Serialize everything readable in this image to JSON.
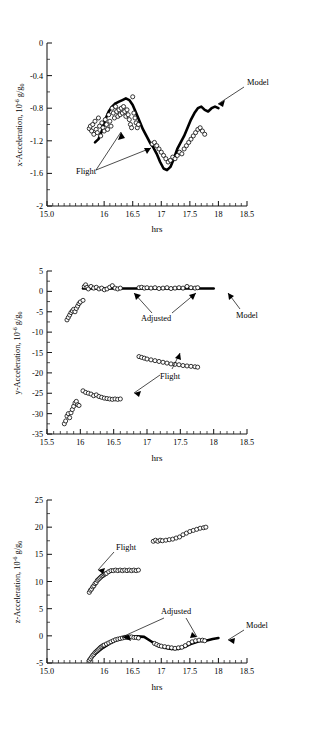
{
  "figure": {
    "panels": [
      {
        "id": "x-acceleration",
        "axis": {
          "xlabel": "hrs",
          "ylabel_main": "x-Acceleration, 10",
          "ylabel_sup": "-6",
          "ylabel_tail": " g/g",
          "ylabel_sub": "0",
          "xticks": [
            "15.0",
            "16",
            "16.5",
            "17",
            "17.5",
            "18",
            "18.5"
          ],
          "yticks": [
            "0",
            "-0.4",
            "-0.8",
            "-1.2",
            "-1.6",
            "-2"
          ]
        },
        "annotations": [
          {
            "label": "Model"
          },
          {
            "label": "Flight"
          }
        ]
      },
      {
        "id": "y-acceleration",
        "axis": {
          "xlabel": "hrs",
          "ylabel_main": "y-Acceleration, 10",
          "ylabel_sup": "-6",
          "ylabel_tail": " g/g",
          "ylabel_sub": "0",
          "xticks": [
            "15.5",
            "16",
            "16.5",
            "17",
            "17.5",
            "18",
            "18.5"
          ],
          "yticks": [
            "5",
            "0",
            "-5",
            "-10",
            "-15",
            "-20",
            "-25",
            "-30",
            "-35"
          ]
        },
        "annotations": [
          {
            "label": "Adjusted"
          },
          {
            "label": "Model"
          },
          {
            "label": "Flight"
          }
        ]
      },
      {
        "id": "z-acceleration",
        "axis": {
          "xlabel": "hrs",
          "ylabel_main": "z-Acceleration, 10",
          "ylabel_sup": "-6",
          "ylabel_tail": " g/g",
          "ylabel_sub": "0",
          "xticks": [
            "15.0",
            "16",
            "16.5",
            "17",
            "17.5",
            "18",
            "18.5"
          ],
          "yticks": [
            "25",
            "20",
            "15",
            "10",
            "5",
            "0",
            "-5"
          ]
        },
        "annotations": [
          {
            "label": "Flight"
          },
          {
            "label": "Adjusted"
          },
          {
            "label": "Model"
          }
        ]
      }
    ]
  },
  "chart_data": [
    {
      "type": "scatter",
      "id": "x-acceleration",
      "title": "",
      "xlabel": "hrs",
      "ylabel": "x-Acceleration, 10^-6 g/g0",
      "xlim": [
        15.0,
        18.5
      ],
      "ylim": [
        -2,
        0
      ],
      "xticks": [
        15.0,
        15.5,
        16.0,
        16.5,
        17.0,
        17.5,
        18.0,
        18.5
      ],
      "xticklabels": [
        "15.0",
        "",
        "16",
        "16.5",
        "17",
        "17.5",
        "18",
        "18.5"
      ],
      "yticks": [
        0,
        -0.4,
        -0.8,
        -1.2,
        -1.6,
        -2
      ],
      "grid": false,
      "legend": "none",
      "series": [
        {
          "name": "Flight",
          "style": "open-circle-markers",
          "x": [
            15.74,
            15.76,
            15.78,
            15.8,
            15.82,
            15.84,
            15.86,
            15.88,
            15.9,
            15.92,
            15.94,
            15.96,
            15.98,
            16.0,
            16.02,
            16.04,
            16.06,
            16.08,
            16.1,
            16.12,
            16.14,
            16.16,
            16.18,
            16.2,
            16.22,
            16.24,
            16.26,
            16.28,
            16.3,
            16.32,
            16.34,
            16.36,
            16.38,
            16.4,
            16.42,
            16.44,
            16.46,
            16.48,
            16.5,
            16.52,
            16.54,
            16.56,
            16.58,
            16.6,
            16.84,
            16.88,
            16.92,
            16.96,
            17.0,
            17.04,
            17.08,
            17.12,
            17.16,
            17.2,
            17.24,
            17.28,
            17.32,
            17.36,
            17.4,
            17.44,
            17.48,
            17.52,
            17.56,
            17.6,
            17.64,
            17.68,
            17.72,
            17.76
          ],
          "y": [
            -1.05,
            -1.02,
            -1.08,
            -1.0,
            -1.12,
            -0.96,
            -1.06,
            -1.1,
            -0.92,
            -1.02,
            -1.14,
            -0.98,
            -1.04,
            -1.08,
            -0.94,
            -1.0,
            -1.06,
            -0.88,
            -0.96,
            -1.02,
            -0.8,
            -0.86,
            -0.92,
            -0.78,
            -0.84,
            -0.9,
            -0.82,
            -0.88,
            -0.8,
            -0.86,
            -0.78,
            -0.84,
            -0.9,
            -0.82,
            -0.88,
            -0.94,
            -1.0,
            -1.04,
            -0.66,
            -0.86,
            -0.92,
            -0.98,
            -1.04,
            -1.0,
            -1.24,
            -1.22,
            -1.26,
            -1.3,
            -1.34,
            -1.38,
            -1.42,
            -1.46,
            -1.44,
            -1.4,
            -1.42,
            -1.38,
            -1.34,
            -1.36,
            -1.3,
            -1.26,
            -1.22,
            -1.18,
            -1.14,
            -1.1,
            -1.06,
            -1.04,
            -1.08,
            -1.12
          ]
        },
        {
          "name": "Model",
          "style": "thick-solid-line",
          "x": [
            15.84,
            15.9,
            15.96,
            16.02,
            16.08,
            16.14,
            16.2,
            16.26,
            16.32,
            16.38,
            16.44,
            16.5,
            16.56,
            16.62,
            16.68,
            16.74,
            16.8,
            16.86,
            16.92,
            16.98,
            17.04,
            17.1,
            17.16,
            17.22,
            17.28,
            17.34,
            17.4,
            17.46,
            17.52,
            17.58,
            17.64,
            17.7,
            17.76,
            17.82,
            17.88,
            17.94,
            18.0
          ],
          "y": [
            -1.22,
            -1.18,
            -1.08,
            -0.94,
            -0.84,
            -0.78,
            -0.74,
            -0.72,
            -0.7,
            -0.68,
            -0.7,
            -0.76,
            -0.86,
            -0.96,
            -1.06,
            -1.14,
            -1.22,
            -1.28,
            -1.36,
            -1.46,
            -1.54,
            -1.56,
            -1.52,
            -1.42,
            -1.3,
            -1.22,
            -1.14,
            -1.04,
            -0.94,
            -0.86,
            -0.8,
            -0.78,
            -0.82,
            -0.84,
            -0.8,
            -0.78,
            -0.8
          ]
        }
      ],
      "annotations": [
        {
          "text": "Model",
          "x": 18.05,
          "y": -0.52
        },
        {
          "text": "Flight",
          "x": 16.05,
          "y": -1.55
        }
      ]
    },
    {
      "type": "scatter",
      "id": "y-acceleration",
      "title": "",
      "xlabel": "hrs",
      "ylabel": "y-Acceleration, 10^-6 g/g0",
      "xlim": [
        15.5,
        18.5
      ],
      "ylim": [
        -35,
        5
      ],
      "xticks": [
        15.5,
        16.0,
        16.5,
        17.0,
        17.5,
        18.0,
        18.5
      ],
      "yticks": [
        5,
        0,
        -5,
        -10,
        -15,
        -20,
        -25,
        -30,
        -35
      ],
      "grid": false,
      "legend": "none",
      "series": [
        {
          "name": "Adjusted",
          "style": "open-circle-markers",
          "x": [
            15.8,
            15.82,
            15.84,
            15.86,
            15.88,
            15.9,
            15.92,
            15.94,
            15.96,
            15.98,
            16.0,
            16.04,
            16.06,
            16.08,
            16.1,
            16.12,
            16.16,
            16.2,
            16.24,
            16.28,
            16.32,
            16.36,
            16.4,
            16.44,
            16.48,
            16.52,
            16.56,
            16.6,
            16.88,
            16.92,
            16.96,
            17.0,
            17.06,
            17.12,
            17.18,
            17.24,
            17.3,
            17.36,
            17.42,
            17.48,
            17.54,
            17.6,
            17.66,
            17.72,
            17.76
          ],
          "y": [
            -7.0,
            -6.4,
            -5.8,
            -5.2,
            -4.8,
            -4.4,
            -5.0,
            -4.2,
            -3.6,
            -3.0,
            -2.6,
            -2.2,
            1.2,
            1.6,
            1.0,
            0.6,
            1.2,
            0.8,
            1.0,
            0.6,
            0.8,
            0.4,
            0.6,
            1.0,
            1.4,
            0.8,
            0.6,
            0.8,
            0.9,
            1.0,
            0.8,
            0.9,
            0.8,
            0.9,
            0.7,
            0.8,
            0.9,
            0.7,
            0.8,
            0.9,
            0.8,
            1.2,
            0.9,
            0.8,
            0.9
          ]
        },
        {
          "name": "Flight",
          "style": "open-circle-markers",
          "x": [
            15.76,
            15.78,
            15.8,
            15.82,
            15.84,
            15.86,
            15.88,
            15.9,
            15.92,
            15.94,
            15.96,
            15.98,
            16.04,
            16.08,
            16.12,
            16.16,
            16.2,
            16.24,
            16.28,
            16.32,
            16.36,
            16.4,
            16.44,
            16.48,
            16.52,
            16.56,
            16.6,
            16.88,
            16.92,
            16.96,
            17.0,
            17.06,
            17.12,
            17.18,
            17.24,
            17.3,
            17.36,
            17.42,
            17.48,
            17.54,
            17.6,
            17.66,
            17.72,
            17.76
          ],
          "y": [
            -32.5,
            -31.8,
            -30.6,
            -30.0,
            -31.0,
            -29.8,
            -29.0,
            -28.2,
            -27.4,
            -27.0,
            -27.8,
            -28.0,
            -24.4,
            -24.8,
            -25.0,
            -25.2,
            -25.6,
            -25.4,
            -25.8,
            -26.0,
            -26.2,
            -26.3,
            -26.4,
            -26.5,
            -26.4,
            -26.5,
            -26.4,
            -16.0,
            -16.2,
            -16.4,
            -16.6,
            -16.8,
            -17.0,
            -17.2,
            -17.4,
            -17.6,
            -17.8,
            -17.9,
            -18.0,
            -18.2,
            -18.3,
            -18.4,
            -18.5,
            -18.6
          ]
        },
        {
          "name": "Model",
          "style": "thick-solid-line",
          "x": [
            16.04,
            16.4,
            16.8,
            17.2,
            17.6,
            18.0
          ],
          "y": [
            0.7,
            0.7,
            0.7,
            0.7,
            0.7,
            0.7
          ]
        }
      ],
      "annotations": [
        {
          "text": "Adjusted",
          "x": 16.82,
          "y": -4.2
        },
        {
          "text": "Model",
          "x": 18.05,
          "y": -3.2
        },
        {
          "text": "Flight",
          "x": 16.92,
          "y": -21.5
        }
      ]
    },
    {
      "type": "scatter",
      "id": "z-acceleration",
      "title": "",
      "xlabel": "hrs",
      "ylabel": "z-Acceleration, 10^-6 g/g0",
      "xlim": [
        15.0,
        18.5
      ],
      "ylim": [
        -5,
        25
      ],
      "xticks": [
        15.0,
        15.5,
        16.0,
        16.5,
        17.0,
        17.5,
        18.0,
        18.5
      ],
      "xticklabels": [
        "15.0",
        "",
        "16",
        "16.5",
        "17",
        "17.5",
        "18",
        "18.5"
      ],
      "yticks": [
        25,
        20,
        15,
        10,
        5,
        0,
        -5
      ],
      "grid": false,
      "legend": "none",
      "series": [
        {
          "name": "Flight",
          "style": "open-circle-markers",
          "x": [
            15.74,
            15.76,
            15.78,
            15.8,
            15.82,
            15.84,
            15.86,
            15.88,
            15.9,
            15.92,
            15.94,
            15.96,
            15.98,
            16.0,
            16.02,
            16.04,
            16.08,
            16.12,
            16.16,
            16.2,
            16.24,
            16.28,
            16.32,
            16.36,
            16.4,
            16.44,
            16.48,
            16.52,
            16.56,
            16.6,
            16.86,
            16.9,
            16.94,
            16.98,
            17.02,
            17.08,
            17.14,
            17.2,
            17.26,
            17.32,
            17.38,
            17.44,
            17.5,
            17.56,
            17.62,
            17.68,
            17.74,
            17.78
          ],
          "y": [
            8.0,
            8.4,
            8.6,
            9.0,
            9.2,
            9.6,
            9.8,
            10.2,
            10.4,
            10.6,
            10.8,
            11.0,
            11.1,
            11.3,
            11.4,
            11.5,
            11.8,
            12.0,
            12.0,
            12.1,
            12.0,
            12.1,
            12.0,
            12.1,
            12.0,
            12.1,
            12.0,
            12.1,
            12.0,
            12.1,
            17.4,
            17.6,
            17.4,
            17.6,
            17.5,
            17.6,
            17.7,
            17.8,
            18.0,
            18.2,
            18.6,
            18.9,
            19.2,
            19.4,
            19.6,
            19.8,
            19.9,
            20.0
          ]
        },
        {
          "name": "Adjusted",
          "style": "open-circle-markers",
          "x": [
            15.74,
            15.76,
            15.78,
            15.8,
            15.82,
            15.84,
            15.86,
            15.88,
            15.9,
            15.92,
            15.94,
            15.96,
            15.98,
            16.0,
            16.04,
            16.08,
            16.12,
            16.16,
            16.2,
            16.24,
            16.28,
            16.32,
            16.36,
            16.4,
            16.44,
            16.48,
            16.52,
            16.56,
            16.6,
            16.88,
            16.92,
            16.96,
            17.0,
            17.06,
            17.12,
            17.18,
            17.24,
            17.3,
            17.36,
            17.42,
            17.48,
            17.54,
            17.6,
            17.66,
            17.72,
            17.76
          ],
          "y": [
            -4.5,
            -4.2,
            -3.9,
            -3.6,
            -3.4,
            -3.1,
            -2.9,
            -2.7,
            -2.5,
            -2.3,
            -2.1,
            -2.0,
            -1.8,
            -1.7,
            -1.5,
            -1.3,
            -1.1,
            -0.9,
            -0.7,
            -0.6,
            -0.5,
            -0.4,
            -0.3,
            -0.3,
            -0.2,
            -0.2,
            -0.3,
            -0.3,
            -0.4,
            -1.4,
            -1.6,
            -1.8,
            -1.9,
            -2.0,
            -2.1,
            -2.2,
            -2.3,
            -2.2,
            -2.1,
            -1.8,
            -1.4,
            -1.1,
            -0.9,
            -0.8,
            -0.8,
            -0.9
          ]
        },
        {
          "name": "Model",
          "style": "thick-solid-line",
          "x": [
            15.74,
            15.86,
            15.98,
            16.1,
            16.22,
            16.34,
            16.46,
            16.58,
            16.7,
            16.82,
            16.94,
            17.06,
            17.18,
            17.3,
            17.42,
            17.54,
            17.66,
            17.78,
            17.9,
            18.0
          ],
          "y": [
            -4.4,
            -3.2,
            -2.2,
            -1.4,
            -0.8,
            -0.4,
            -0.2,
            -0.1,
            -0.2,
            -1.0,
            -1.8,
            -2.2,
            -2.4,
            -2.4,
            -2.0,
            -1.4,
            -1.0,
            -0.9,
            -0.6,
            -0.4
          ]
        }
      ],
      "annotations": [
        {
          "text": "Flight",
          "x": 16.32,
          "y": 15.6
        },
        {
          "text": "Adjusted",
          "x": 16.86,
          "y": 5.2
        },
        {
          "text": "Model",
          "x": 18.04,
          "y": 1.8
        }
      ]
    }
  ]
}
